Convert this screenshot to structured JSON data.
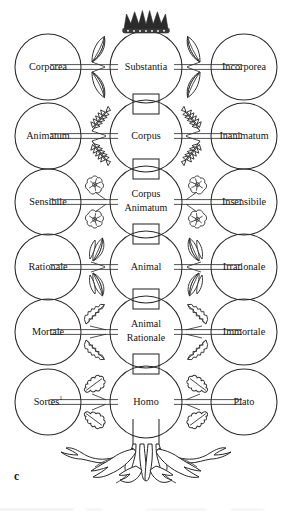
{
  "figure": {
    "caption": "c",
    "ink_color": "#2b2b2b",
    "background_color": "#ffffff"
  },
  "diagram": {
    "type": "tree-diagram",
    "crown_icon": "crown-icon",
    "roots_icon": "tree-roots-icon",
    "trunk_icon": "trunk-segment-icon",
    "rows": [
      {
        "index": 1,
        "center": "Substantia",
        "left": "Corporea",
        "right": "Incorporea",
        "leaf_icon": "pointed-leaf-icon",
        "has_crown": true
      },
      {
        "index": 2,
        "center": "Corpus",
        "left": "Animatum",
        "right": "Inanimatum",
        "leaf_icon": "fern-leaf-icon",
        "has_crown": false
      },
      {
        "index": 3,
        "center": "Corpus Animatum",
        "center_line1": "Corpus",
        "center_line2": "Animatum",
        "left": "Sensibile",
        "right": "Insensibile",
        "leaf_icon": "blossom-flower-icon",
        "has_crown": false
      },
      {
        "index": 4,
        "center": "Animal",
        "left": "Rationale",
        "right": "Irrationale",
        "leaf_icon": "double-leaf-icon",
        "has_crown": false
      },
      {
        "index": 5,
        "center": "Animal Rationale",
        "center_line1": "Animal",
        "center_line2": "Rationale",
        "left": "Mortale",
        "right": "Immortale",
        "leaf_icon": "serrated-leaf-icon",
        "has_crown": false
      },
      {
        "index": 6,
        "center": "Homo",
        "left": "Sortes",
        "left_superscript": "1",
        "right": "Plato",
        "leaf_icon": "oak-leaf-icon",
        "has_crown": false
      }
    ]
  }
}
